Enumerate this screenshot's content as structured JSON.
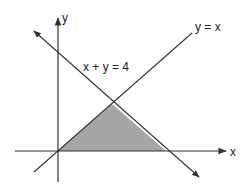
{
  "diagram": {
    "axes": {
      "x_label": "x",
      "y_label": "y"
    },
    "lines": [
      {
        "name": "y-equals-x",
        "equation": "y = x"
      },
      {
        "name": "x-plus-y-equals-4",
        "equation": "x + y = 4"
      }
    ],
    "region": {
      "description": "shaded triangle",
      "vertices": [
        [
          0,
          0
        ],
        [
          2,
          2
        ],
        [
          4,
          0
        ]
      ],
      "fill": "#a6a6a6"
    },
    "colors": {
      "line": "#333333",
      "shade": "#a6a6a6"
    }
  }
}
